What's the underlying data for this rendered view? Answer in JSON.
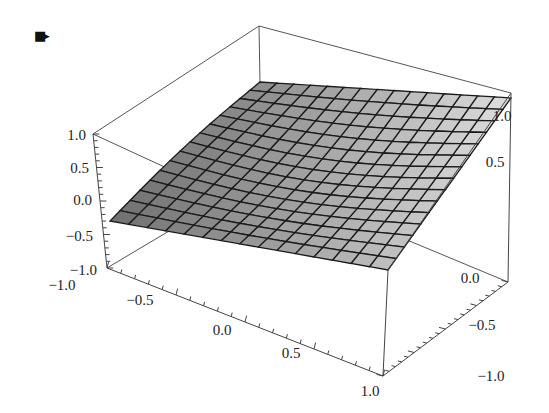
{
  "cell_marker": {
    "icon": "cell-output-bracket-icon",
    "glyph": "■▸"
  },
  "chart_data": {
    "type": "surface3d",
    "title": "",
    "function_shape": "saddle-like surface, high at back corner, dips to 0 at left tip",
    "xlabel": "",
    "ylabel": "",
    "zlabel": "",
    "x_range": [
      -1.0,
      1.0
    ],
    "y_range": [
      -1.0,
      1.0
    ],
    "z_range": [
      -1.0,
      1.0
    ],
    "x_ticks": [
      "-1.0",
      "-0.5",
      "0.0",
      "0.5",
      "1.0"
    ],
    "y_ticks": [
      "1.0",
      "0.5",
      "0.0",
      "-0.5",
      "-1.0"
    ],
    "z_ticks": [
      "1.0",
      "0.5",
      "0.0",
      "-0.5",
      "-1.0"
    ],
    "mesh_lines": 15,
    "surface_color": "#a8a8a8",
    "mesh_color": "#1a1a1a",
    "box": true
  }
}
